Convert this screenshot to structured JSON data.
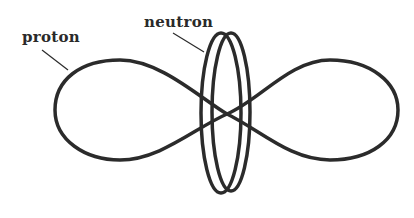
{
  "diagram": {
    "labels": {
      "proton": "proton",
      "neutron": "neutron"
    },
    "colors": {
      "stroke": "#2b2b2b",
      "background": "#ffffff"
    }
  }
}
